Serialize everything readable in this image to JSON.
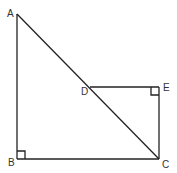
{
  "diagram": {
    "type": "geometry",
    "stroke_color": "#222222",
    "label_color": "#333333",
    "points": {
      "A": {
        "x": 17,
        "y": 14,
        "label": "A"
      },
      "B": {
        "x": 17,
        "y": 159,
        "label": "B"
      },
      "C": {
        "x": 159,
        "y": 159,
        "label": "C"
      },
      "D": {
        "x": 90,
        "y": 87,
        "label": "D"
      },
      "E": {
        "x": 159,
        "y": 87,
        "label": "E"
      }
    },
    "segments": [
      "AB",
      "BC",
      "AC",
      "DE",
      "EC"
    ],
    "right_angles": [
      "B",
      "E"
    ]
  }
}
